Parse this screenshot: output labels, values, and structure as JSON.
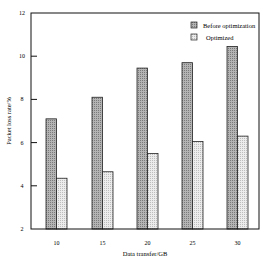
{
  "chart_data": {
    "type": "bar",
    "title": "",
    "xlabel": "Data transfer/GB",
    "ylabel": "Packet loss rate/%",
    "categories": [
      "10",
      "15",
      "20",
      "25",
      "30"
    ],
    "series": [
      {
        "name": "Before optimization",
        "values": [
          7.1,
          8.1,
          9.45,
          9.7,
          10.45
        ],
        "fill": "#9e9e9e"
      },
      {
        "name": "Optimized",
        "values": [
          4.35,
          4.65,
          5.5,
          6.05,
          6.3
        ],
        "fill": "#dcdcdc"
      }
    ],
    "ylim": [
      2,
      12
    ],
    "yticks": [
      "2",
      "4",
      "6",
      "8",
      "10",
      "12"
    ],
    "grid": false,
    "legend_position": "upper right"
  },
  "colors": {
    "axis": "#111111",
    "before_fill": "#9e9e9e",
    "optimized_fill": "#dcdcdc",
    "outline": "#222222"
  }
}
